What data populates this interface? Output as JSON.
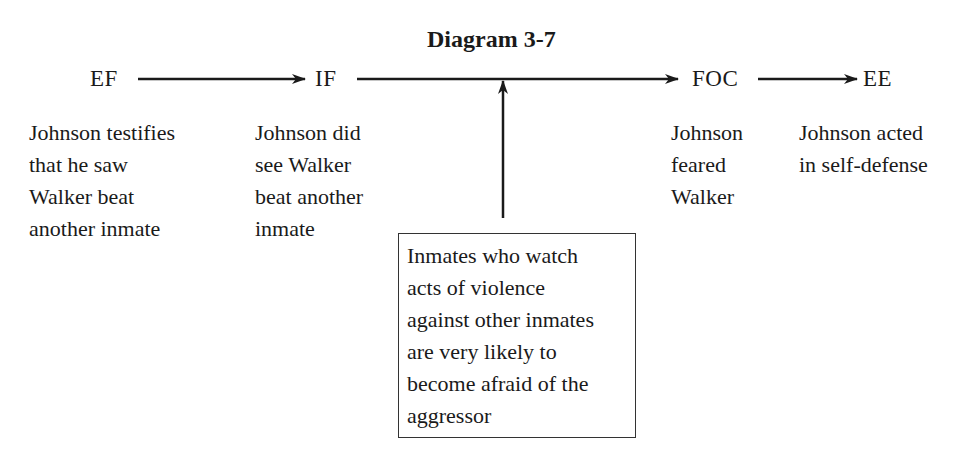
{
  "title": "Diagram 3-7",
  "nodes": [
    {
      "id": "EF",
      "label": "EF",
      "desc": [
        "Johnson testifies",
        "that he saw",
        "Walker beat",
        "another inmate"
      ]
    },
    {
      "id": "IF",
      "label": "IF",
      "desc": [
        "Johnson did",
        "see Walker",
        "beat another",
        "inmate"
      ]
    },
    {
      "id": "FOC",
      "label": "FOC",
      "desc": [
        "Johnson",
        "feared",
        "Walker"
      ]
    },
    {
      "id": "EE",
      "label": "EE",
      "desc": [
        "Johnson acted",
        "in self-defense"
      ]
    }
  ],
  "warrant": {
    "lines": [
      "Inmates who watch",
      "acts of violence",
      "against other inmates",
      "are very likely to",
      "become afraid of the",
      "aggressor"
    ]
  },
  "edges": [
    {
      "from": "EF",
      "to": "IF"
    },
    {
      "from": "IF",
      "to": "FOC"
    },
    {
      "from": "FOC",
      "to": "EE"
    },
    {
      "from": "warrant",
      "to": "IF-FOC edge"
    }
  ],
  "colors": {
    "ink": "#1a1a1a",
    "background": "#ffffff"
  }
}
